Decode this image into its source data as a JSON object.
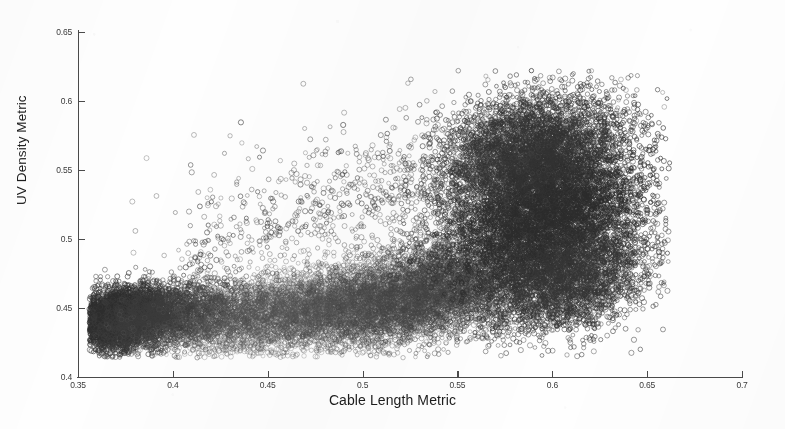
{
  "chart_data": {
    "type": "scatter",
    "title": "",
    "xlabel": "Cable Length Metric",
    "ylabel": "UV Density Metric",
    "xlim": [
      0.35,
      0.7
    ],
    "ylim": [
      0.4,
      0.65
    ],
    "xticks": [
      0.35,
      0.4,
      0.45,
      0.5,
      0.55,
      0.6,
      0.65,
      0.7
    ],
    "yticks": [
      0.4,
      0.45,
      0.5,
      0.55,
      0.6,
      0.65
    ],
    "xticklabels": [
      "0.35",
      "0.4",
      "0.45",
      "0.5",
      "0.55",
      "0.6",
      "0.65",
      "0.7"
    ],
    "yticklabels": [
      "0.4",
      "0.45",
      "0.5",
      "0.55",
      "0.6",
      "0.65"
    ],
    "grid": false,
    "legend": false,
    "marker": "open-circle",
    "marker_size_px": 4.4,
    "marker_color": "#3c3c3c",
    "point_count_approx": 30000,
    "background_color": "#fefefe",
    "axis_color": "#4a4a4a",
    "clusters": [
      {
        "name": "left-dense-core",
        "x_center": 0.372,
        "y_center": 0.443,
        "x_spread": 0.012,
        "y_spread": 0.01,
        "n": 4200,
        "darkness": 0.92
      },
      {
        "name": "left-tail",
        "x_center": 0.398,
        "y_center": 0.444,
        "x_spread": 0.022,
        "y_spread": 0.011,
        "n": 2600,
        "darkness": 0.72
      },
      {
        "name": "mid-light-band",
        "x_center": 0.462,
        "y_center": 0.448,
        "x_spread": 0.032,
        "y_spread": 0.013,
        "n": 4200,
        "darkness": 0.36
      },
      {
        "name": "mid-band-right",
        "x_center": 0.515,
        "y_center": 0.452,
        "x_spread": 0.028,
        "y_spread": 0.014,
        "n": 3600,
        "darkness": 0.46
      },
      {
        "name": "bridge-rise",
        "x_center": 0.548,
        "y_center": 0.47,
        "x_spread": 0.026,
        "y_spread": 0.02,
        "n": 2800,
        "darkness": 0.62
      },
      {
        "name": "right-dense-core",
        "x_center": 0.598,
        "y_center": 0.52,
        "x_spread": 0.024,
        "y_spread": 0.03,
        "n": 7400,
        "darkness": 0.95
      },
      {
        "name": "right-upper-lobe",
        "x_center": 0.585,
        "y_center": 0.565,
        "x_spread": 0.022,
        "y_spread": 0.02,
        "n": 3000,
        "darkness": 0.85
      },
      {
        "name": "right-lower-lobe",
        "x_center": 0.608,
        "y_center": 0.468,
        "x_spread": 0.022,
        "y_spread": 0.018,
        "n": 2400,
        "darkness": 0.8
      },
      {
        "name": "upper-sparse-outliers",
        "x_center": 0.52,
        "y_center": 0.53,
        "x_spread": 0.06,
        "y_spread": 0.03,
        "n": 700,
        "darkness": 0.55
      }
    ],
    "extremes": {
      "x_min": 0.356,
      "x_max": 0.662,
      "y_min": 0.414,
      "y_max": 0.622,
      "top_outlier": {
        "x": 0.589,
        "y": 0.622
      }
    }
  },
  "axis": {
    "x_label": "Cable Length Metric",
    "y_label": "UV Density Metric"
  }
}
